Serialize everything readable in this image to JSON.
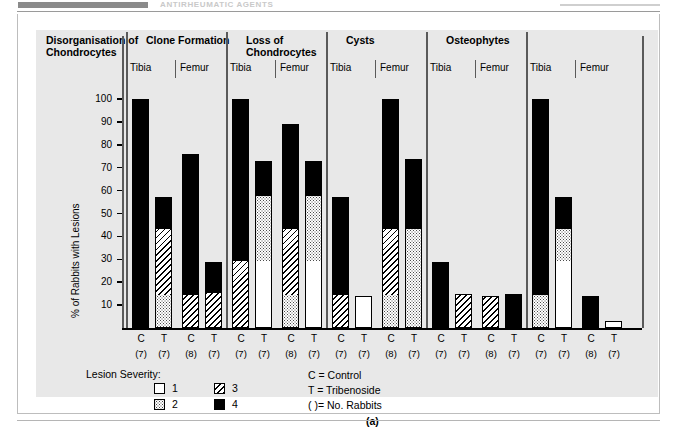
{
  "page_header": {
    "running_title": "ANTIRHEUMATIC AGENTS",
    "bar_color": "#8b8b8b"
  },
  "chart_data": {
    "type": "bar",
    "subtype": "stacked-grouped",
    "title": "",
    "panel_letter": "(a)",
    "xlabel": "",
    "ylabel": "% of Rabbits with Lesions",
    "ylim": [
      0,
      105
    ],
    "yticks": [
      10,
      20,
      30,
      40,
      50,
      60,
      70,
      80,
      90,
      100
    ],
    "grid": false,
    "legend_position": "bottom-left",
    "stack_order": [
      "1",
      "2",
      "3",
      "4"
    ],
    "severity_legend": {
      "title": "Lesion Severity:",
      "items": [
        {
          "key": "1",
          "label": "1",
          "pattern": "white"
        },
        {
          "key": "2",
          "label": "2",
          "pattern": "dotted"
        },
        {
          "key": "3",
          "label": "3",
          "pattern": "hatched"
        },
        {
          "key": "4",
          "label": "4",
          "pattern": "black"
        }
      ]
    },
    "notes": [
      "C = Control",
      "T = Tribenoside",
      "( )= No. Rabbits"
    ],
    "groups": [
      {
        "title": "Disorganisation of\nChondrocytes",
        "bones": [
          {
            "bone": "Tibia",
            "bars": [
              {
                "cat": "C",
                "n": "(7)",
                "total": 100,
                "segments": {
                  "1": 0,
                  "2": 0,
                  "3": 0,
                  "4": 100
                }
              },
              {
                "cat": "T",
                "n": "(7)",
                "total": 57,
                "segments": {
                  "1": 0,
                  "2": 14,
                  "3": 29,
                  "4": 14
                }
              }
            ]
          },
          {
            "bone": "Femur",
            "bars": [
              {
                "cat": "C",
                "n": "(8)",
                "total": 76,
                "segments": {
                  "1": 0,
                  "2": 0,
                  "3": 14,
                  "4": 62
                }
              },
              {
                "cat": "T",
                "n": "(7)",
                "total": 29,
                "segments": {
                  "1": 0,
                  "2": 0,
                  "3": 15,
                  "4": 14
                }
              }
            ]
          }
        ]
      },
      {
        "title": "Clone Formation",
        "bones": [
          {
            "bone": "Tibia",
            "bars": [
              {
                "cat": "C",
                "n": "(7)",
                "total": 100,
                "segments": {
                  "1": 0,
                  "2": 0,
                  "3": 29,
                  "4": 71
                }
              },
              {
                "cat": "T",
                "n": "(7)",
                "total": 73,
                "segments": {
                  "1": 29,
                  "2": 28,
                  "3": 0,
                  "4": 16
                }
              }
            ]
          },
          {
            "bone": "Femur",
            "bars": [
              {
                "cat": "C",
                "n": "(8)",
                "total": 89,
                "segments": {
                  "1": 0,
                  "2": 14,
                  "3": 29,
                  "4": 46
                }
              },
              {
                "cat": "T",
                "n": "(7)",
                "total": 73,
                "segments": {
                  "1": 29,
                  "2": 28,
                  "3": 0,
                  "4": 16
                }
              }
            ]
          }
        ]
      },
      {
        "title": "Loss of\nChondrocytes",
        "bones": [
          {
            "bone": "Tibia",
            "bars": [
              {
                "cat": "C",
                "n": "(7)",
                "total": 57,
                "segments": {
                  "1": 0,
                  "2": 0,
                  "3": 14,
                  "4": 43
                }
              },
              {
                "cat": "T",
                "n": "(7)",
                "total": 14,
                "segments": {
                  "1": 14,
                  "2": 0,
                  "3": 0,
                  "4": 0
                }
              }
            ]
          },
          {
            "bone": "Femur",
            "bars": [
              {
                "cat": "C",
                "n": "(8)",
                "total": 100,
                "segments": {
                  "1": 0,
                  "2": 14,
                  "3": 29,
                  "4": 57
                }
              },
              {
                "cat": "T",
                "n": "(7)",
                "total": 74,
                "segments": {
                  "1": 0,
                  "2": 43,
                  "3": 0,
                  "4": 31
                }
              }
            ]
          }
        ]
      },
      {
        "title": "Cysts",
        "bones": [
          {
            "bone": "Tibia",
            "bars": [
              {
                "cat": "C",
                "n": "(7)",
                "total": 29,
                "segments": {
                  "1": 0,
                  "2": 0,
                  "3": 0,
                  "4": 29
                }
              },
              {
                "cat": "T",
                "n": "(7)",
                "total": 15,
                "segments": {
                  "1": 0,
                  "2": 0,
                  "3": 15,
                  "4": 0
                }
              }
            ]
          },
          {
            "bone": "Femur",
            "bars": [
              {
                "cat": "C",
                "n": "(8)",
                "total": 14,
                "segments": {
                  "1": 0,
                  "2": 0,
                  "3": 14,
                  "4": 0
                }
              },
              {
                "cat": "T",
                "n": "(7)",
                "total": 15,
                "segments": {
                  "1": 0,
                  "2": 0,
                  "3": 0,
                  "4": 15
                }
              }
            ]
          }
        ]
      },
      {
        "title": "Osteophytes",
        "bones": [
          {
            "bone": "Tibia",
            "bars": [
              {
                "cat": "C",
                "n": "(7)",
                "total": 100,
                "segments": {
                  "1": 0,
                  "2": 14,
                  "3": 0,
                  "4": 86
                }
              },
              {
                "cat": "T",
                "n": "(7)",
                "total": 57,
                "segments": {
                  "1": 29,
                  "2": 14,
                  "3": 0,
                  "4": 14
                }
              }
            ]
          },
          {
            "bone": "Femur",
            "bars": [
              {
                "cat": "C",
                "n": "(8)",
                "total": 14,
                "segments": {
                  "1": 0,
                  "2": 0,
                  "3": 0,
                  "4": 14
                }
              },
              {
                "cat": "T",
                "n": "(7)",
                "total": 3,
                "segments": {
                  "1": 3,
                  "2": 0,
                  "3": 0,
                  "4": 0
                }
              }
            ]
          }
        ]
      }
    ]
  }
}
